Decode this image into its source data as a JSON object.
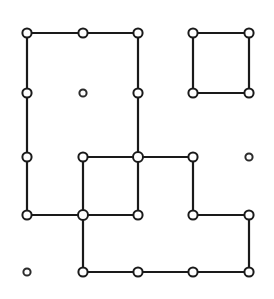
{
  "diagram": {
    "type": "grid-graph",
    "canvas": {
      "width": 274,
      "height": 299,
      "background_color": "#ffffff"
    },
    "style": {
      "edge_color": "#1a1a1a",
      "edge_width": 2.2,
      "node_stroke_color": "#1a1a1a",
      "node_fill_color": "#ffffff",
      "node_stroke_width": 2.0,
      "node_radius_connected": 4.6,
      "node_radius_isolated": 3.6,
      "node_radius_junction": 5.0
    },
    "grid": {
      "columns": 5,
      "rows": 5,
      "column_x": [
        27,
        83,
        138,
        193,
        249
      ],
      "row_y": [
        33,
        93,
        157,
        215,
        272
      ]
    },
    "nodes": [
      {
        "id": "n0_0",
        "col": 0,
        "row": 0,
        "x": 27,
        "y": 33,
        "kind": "connected"
      },
      {
        "id": "n1_0",
        "col": 1,
        "row": 0,
        "x": 83,
        "y": 33,
        "kind": "connected"
      },
      {
        "id": "n2_0",
        "col": 2,
        "row": 0,
        "x": 138,
        "y": 33,
        "kind": "connected"
      },
      {
        "id": "n3_0",
        "col": 3,
        "row": 0,
        "x": 193,
        "y": 33,
        "kind": "connected"
      },
      {
        "id": "n4_0",
        "col": 4,
        "row": 0,
        "x": 249,
        "y": 33,
        "kind": "connected"
      },
      {
        "id": "n0_1",
        "col": 0,
        "row": 1,
        "x": 27,
        "y": 93,
        "kind": "connected"
      },
      {
        "id": "n1_1",
        "col": 1,
        "row": 1,
        "x": 83,
        "y": 93,
        "kind": "isolated"
      },
      {
        "id": "n2_1",
        "col": 2,
        "row": 1,
        "x": 138,
        "y": 93,
        "kind": "connected"
      },
      {
        "id": "n3_1",
        "col": 3,
        "row": 1,
        "x": 193,
        "y": 93,
        "kind": "connected"
      },
      {
        "id": "n4_1",
        "col": 4,
        "row": 1,
        "x": 249,
        "y": 93,
        "kind": "connected"
      },
      {
        "id": "n0_2",
        "col": 0,
        "row": 2,
        "x": 27,
        "y": 157,
        "kind": "connected"
      },
      {
        "id": "n1_2",
        "col": 1,
        "row": 2,
        "x": 83,
        "y": 157,
        "kind": "connected"
      },
      {
        "id": "n2_2",
        "col": 2,
        "row": 2,
        "x": 138,
        "y": 157,
        "kind": "junction"
      },
      {
        "id": "n3_2",
        "col": 3,
        "row": 2,
        "x": 193,
        "y": 157,
        "kind": "connected"
      },
      {
        "id": "n4_2",
        "col": 4,
        "row": 2,
        "x": 249,
        "y": 157,
        "kind": "isolated"
      },
      {
        "id": "n0_3",
        "col": 0,
        "row": 3,
        "x": 27,
        "y": 215,
        "kind": "connected"
      },
      {
        "id": "n1_3",
        "col": 1,
        "row": 3,
        "x": 83,
        "y": 215,
        "kind": "junction"
      },
      {
        "id": "n2_3",
        "col": 2,
        "row": 3,
        "x": 138,
        "y": 215,
        "kind": "connected"
      },
      {
        "id": "n3_3",
        "col": 3,
        "row": 3,
        "x": 193,
        "y": 215,
        "kind": "connected"
      },
      {
        "id": "n4_3",
        "col": 4,
        "row": 3,
        "x": 249,
        "y": 215,
        "kind": "connected"
      },
      {
        "id": "n0_4",
        "col": 0,
        "row": 4,
        "x": 27,
        "y": 272,
        "kind": "isolated"
      },
      {
        "id": "n1_4",
        "col": 1,
        "row": 4,
        "x": 83,
        "y": 272,
        "kind": "connected"
      },
      {
        "id": "n2_4",
        "col": 2,
        "row": 4,
        "x": 138,
        "y": 272,
        "kind": "connected"
      },
      {
        "id": "n3_4",
        "col": 3,
        "row": 4,
        "x": 193,
        "y": 272,
        "kind": "connected"
      },
      {
        "id": "n4_4",
        "col": 4,
        "row": 4,
        "x": 249,
        "y": 272,
        "kind": "connected"
      }
    ],
    "edges": [
      {
        "id": "e_top_left_a",
        "from": "n0_0",
        "to": "n1_0",
        "x1": 27,
        "y1": 33,
        "x2": 83,
        "y2": 33
      },
      {
        "id": "e_top_left_b",
        "from": "n1_0",
        "to": "n2_0",
        "x1": 83,
        "y1": 33,
        "x2": 138,
        "y2": 33
      },
      {
        "id": "e_top_right_a",
        "from": "n3_0",
        "to": "n4_0",
        "x1": 193,
        "y1": 33,
        "x2": 249,
        "y2": 33
      },
      {
        "id": "e_col0_r0_r1",
        "from": "n0_0",
        "to": "n0_1",
        "x1": 27,
        "y1": 33,
        "x2": 27,
        "y2": 93
      },
      {
        "id": "e_col0_r1_r2",
        "from": "n0_1",
        "to": "n0_2",
        "x1": 27,
        "y1": 93,
        "x2": 27,
        "y2": 157
      },
      {
        "id": "e_col0_r2_r3",
        "from": "n0_2",
        "to": "n0_3",
        "x1": 27,
        "y1": 157,
        "x2": 27,
        "y2": 215
      },
      {
        "id": "e_col2_r0_r1",
        "from": "n2_0",
        "to": "n2_1",
        "x1": 138,
        "y1": 33,
        "x2": 138,
        "y2": 93
      },
      {
        "id": "e_col2_r1_r2",
        "from": "n2_1",
        "to": "n2_2",
        "x1": 138,
        "y1": 93,
        "x2": 138,
        "y2": 157
      },
      {
        "id": "e_col3_r0_r1",
        "from": "n3_0",
        "to": "n3_1",
        "x1": 193,
        "y1": 33,
        "x2": 193,
        "y2": 93
      },
      {
        "id": "e_col4_r0_r1",
        "from": "n4_0",
        "to": "n4_1",
        "x1": 249,
        "y1": 33,
        "x2": 249,
        "y2": 93
      },
      {
        "id": "e_sq_bottom",
        "from": "n3_1",
        "to": "n4_1",
        "x1": 193,
        "y1": 93,
        "x2": 249,
        "y2": 93
      },
      {
        "id": "e_row2_c1_c2",
        "from": "n1_2",
        "to": "n2_2",
        "x1": 83,
        "y1": 157,
        "x2": 138,
        "y2": 157
      },
      {
        "id": "e_row2_c2_c3",
        "from": "n2_2",
        "to": "n3_2",
        "x1": 138,
        "y1": 157,
        "x2": 193,
        "y2": 157
      },
      {
        "id": "e_col1_r2_r3",
        "from": "n1_2",
        "to": "n1_3",
        "x1": 83,
        "y1": 157,
        "x2": 83,
        "y2": 215
      },
      {
        "id": "e_col2_r2_r3",
        "from": "n2_2",
        "to": "n2_3",
        "x1": 138,
        "y1": 157,
        "x2": 138,
        "y2": 215
      },
      {
        "id": "e_col3_r2_r3",
        "from": "n3_2",
        "to": "n3_3",
        "x1": 193,
        "y1": 157,
        "x2": 193,
        "y2": 215
      },
      {
        "id": "e_row3_c0_c1",
        "from": "n0_3",
        "to": "n1_3",
        "x1": 27,
        "y1": 215,
        "x2": 83,
        "y2": 215
      },
      {
        "id": "e_row3_c1_c2",
        "from": "n1_3",
        "to": "n2_3",
        "x1": 83,
        "y1": 215,
        "x2": 138,
        "y2": 215
      },
      {
        "id": "e_row3_c3_c4",
        "from": "n3_3",
        "to": "n4_3",
        "x1": 193,
        "y1": 215,
        "x2": 249,
        "y2": 215
      },
      {
        "id": "e_col1_r3_r4",
        "from": "n1_3",
        "to": "n1_4",
        "x1": 83,
        "y1": 215,
        "x2": 83,
        "y2": 272
      },
      {
        "id": "e_col4_r3_r4",
        "from": "n4_3",
        "to": "n4_4",
        "x1": 249,
        "y1": 215,
        "x2": 249,
        "y2": 272
      },
      {
        "id": "e_row4_c1_c2",
        "from": "n1_4",
        "to": "n2_4",
        "x1": 83,
        "y1": 272,
        "x2": 138,
        "y2": 272
      },
      {
        "id": "e_row4_c2_c3",
        "from": "n2_4",
        "to": "n3_4",
        "x1": 138,
        "y1": 272,
        "x2": 193,
        "y2": 272
      },
      {
        "id": "e_row4_c3_c4",
        "from": "n3_4",
        "to": "n4_4",
        "x1": 193,
        "y1": 272,
        "x2": 249,
        "y2": 272
      }
    ]
  }
}
